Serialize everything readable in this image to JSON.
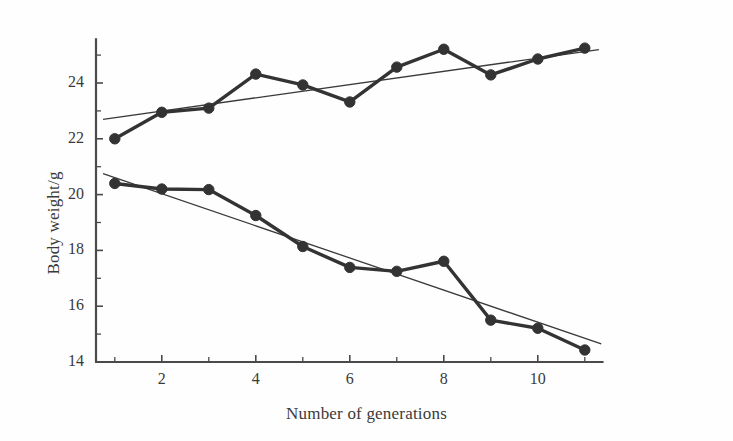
{
  "chart_data": {
    "type": "line",
    "title": "",
    "xlabel": "Number of generations",
    "ylabel": "Body weight/g",
    "x": [
      1,
      2,
      3,
      4,
      5,
      6,
      7,
      8,
      9,
      10,
      11
    ],
    "xlim": [
      0.6,
      11.4
    ],
    "ylim": [
      14,
      25.6
    ],
    "xticks": [
      2,
      4,
      6,
      8,
      10
    ],
    "xtick_labels": [
      "2",
      "4",
      "6",
      "8",
      "10"
    ],
    "x_minor_ticks": [
      1,
      3,
      5,
      7,
      9,
      11
    ],
    "yticks": [
      14,
      16,
      18,
      20,
      22,
      24
    ],
    "ytick_labels": [
      "14",
      "16",
      "18",
      "20",
      "22",
      "24"
    ],
    "y_minor_ticks": [
      15,
      17,
      19,
      21,
      23,
      25
    ],
    "grid": false,
    "legend": "none",
    "series": [
      {
        "name": "upward-selected-line",
        "marker": "filled-circle",
        "color": "#333333",
        "values": [
          22.0,
          22.95,
          23.1,
          24.32,
          23.93,
          23.32,
          24.57,
          25.21,
          24.29,
          24.86,
          25.25
        ],
        "trend_line": {
          "name": "upward-regression-line",
          "x_start": 0.75,
          "y_start": 22.7,
          "x_end": 11.3,
          "y_end": 25.2
        }
      },
      {
        "name": "downward-selected-line",
        "marker": "filled-circle",
        "color": "#333333",
        "values": [
          20.4,
          20.2,
          20.18,
          19.25,
          18.14,
          17.39,
          17.25,
          17.61,
          15.5,
          15.21,
          14.43
        ],
        "trend_line": {
          "name": "downward-regression-line",
          "x_start": 0.75,
          "y_start": 20.75,
          "x_end": 11.35,
          "y_end": 14.65
        }
      }
    ]
  },
  "axes": {
    "x_title": "Number of generations",
    "y_title": "Body weight/g"
  },
  "style": {
    "line_color": "#333333",
    "axis_color": "#4a4a4a",
    "marker_color": "#333333",
    "trend_color": "#3a3a3a",
    "background": "#fefefe"
  }
}
